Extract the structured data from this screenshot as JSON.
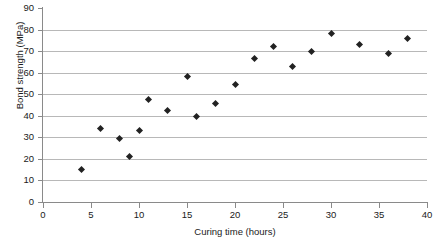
{
  "chart_data": {
    "type": "scatter",
    "title": "",
    "xlabel": "Curing time (hours)",
    "ylabel": "Bond strength (MPa)",
    "xlim": [
      0,
      40
    ],
    "ylim": [
      0,
      90
    ],
    "xticks": [
      0,
      5,
      10,
      15,
      20,
      25,
      30,
      35,
      40
    ],
    "yticks": [
      0,
      10,
      20,
      30,
      40,
      50,
      60,
      70,
      80,
      90
    ],
    "grid": "horizontal",
    "legend": "none",
    "marker": "diamond",
    "marker_color": "#222222",
    "grid_color": "#b8b8b8",
    "axis_color": "#8a8a8a",
    "points": [
      {
        "x": 4,
        "y": 15.0
      },
      {
        "x": 6,
        "y": 34.0
      },
      {
        "x": 8,
        "y": 29.5
      },
      {
        "x": 9,
        "y": 21.0
      },
      {
        "x": 10,
        "y": 33.0
      },
      {
        "x": 11,
        "y": 47.5
      },
      {
        "x": 13,
        "y": 42.5
      },
      {
        "x": 15,
        "y": 58.0
      },
      {
        "x": 16,
        "y": 39.5
      },
      {
        "x": 18,
        "y": 45.5
      },
      {
        "x": 20,
        "y": 54.5
      },
      {
        "x": 22,
        "y": 66.5
      },
      {
        "x": 24,
        "y": 72.0
      },
      {
        "x": 26,
        "y": 63.0
      },
      {
        "x": 28,
        "y": 70.0
      },
      {
        "x": 30,
        "y": 78.0
      },
      {
        "x": 33,
        "y": 73.0
      },
      {
        "x": 36,
        "y": 69.0
      },
      {
        "x": 38,
        "y": 76.0
      }
    ],
    "x": [
      4,
      6,
      8,
      9,
      10,
      11,
      13,
      15,
      16,
      18,
      20,
      22,
      24,
      26,
      28,
      30,
      33,
      36,
      38
    ],
    "values": [
      15.0,
      34.0,
      29.5,
      21.0,
      33.0,
      47.5,
      42.5,
      58.0,
      39.5,
      45.5,
      54.5,
      66.5,
      72.0,
      63.0,
      70.0,
      78.0,
      73.0,
      69.0,
      76.0
    ]
  }
}
